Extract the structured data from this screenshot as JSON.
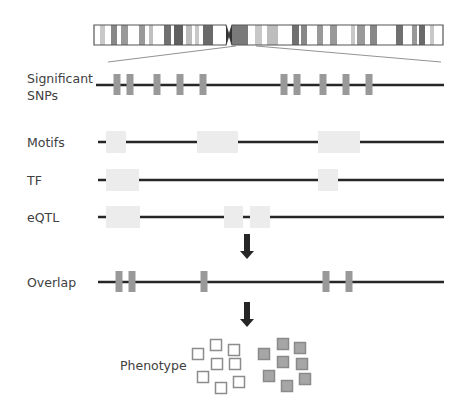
{
  "labels": {
    "significant_snps_line1": "Significant",
    "significant_snps_line2": "SNPs",
    "motifs": "Motifs",
    "tf": "TF",
    "eqtl": "eQTL",
    "overlap": "Overlap",
    "phenotype": "Phenotype"
  },
  "colors": {
    "track_line": "#262626",
    "snp_marker": "#999999",
    "region_box": "#ececec",
    "chromosome_outline": "#555555",
    "open_square": "#8c8c8c",
    "filled_square": "#a6a6a6",
    "arrow": "#262626"
  },
  "chromosome": {
    "x": 94,
    "y": 25,
    "width": 349,
    "height": 20,
    "centromere_x": 229,
    "bands": [
      {
        "x": 100,
        "w": 5,
        "c": "#c8c8c8"
      },
      {
        "x": 111,
        "w": 6,
        "c": "#888888"
      },
      {
        "x": 121,
        "w": 7,
        "c": "#999999"
      },
      {
        "x": 139,
        "w": 6,
        "c": "#999999"
      },
      {
        "x": 149,
        "w": 4,
        "c": "#c0c0c0"
      },
      {
        "x": 164,
        "w": 7,
        "c": "#707070"
      },
      {
        "x": 174,
        "w": 9,
        "c": "#606060"
      },
      {
        "x": 186,
        "w": 6,
        "c": "#bdbdbd"
      },
      {
        "x": 195,
        "w": 4,
        "c": "#c8c8c8"
      },
      {
        "x": 203,
        "w": 10,
        "c": "#6a6a6a"
      },
      {
        "x": 232,
        "w": 16,
        "c": "#7a7a7a"
      },
      {
        "x": 255,
        "w": 7,
        "c": "#c8c8c8"
      },
      {
        "x": 267,
        "w": 11,
        "c": "#bdbdbd"
      },
      {
        "x": 292,
        "w": 7,
        "c": "#707070"
      },
      {
        "x": 301,
        "w": 6,
        "c": "#888888"
      },
      {
        "x": 317,
        "w": 6,
        "c": "#999999"
      },
      {
        "x": 330,
        "w": 7,
        "c": "#999999"
      },
      {
        "x": 351,
        "w": 4,
        "c": "#c8c8c8"
      },
      {
        "x": 357,
        "w": 8,
        "c": "#999999"
      },
      {
        "x": 370,
        "w": 7,
        "c": "#888888"
      },
      {
        "x": 396,
        "w": 7,
        "c": "#707070"
      },
      {
        "x": 412,
        "w": 5,
        "c": "#999999"
      },
      {
        "x": 419,
        "w": 6,
        "c": "#6a6a6a"
      },
      {
        "x": 430,
        "w": 4,
        "c": "#c8c8c8"
      }
    ]
  },
  "zoom_lines": [
    {
      "x1": 236,
      "y1": 46,
      "x2": 108,
      "y2": 62
    },
    {
      "x1": 256,
      "y1": 46,
      "x2": 441,
      "y2": 62
    }
  ],
  "tracks": {
    "snps": {
      "y": 85,
      "x_start": 96,
      "x_end": 444,
      "markers": [
        117,
        130,
        157,
        180,
        203,
        284,
        297,
        323,
        346,
        369
      ]
    },
    "motifs": {
      "y": 142,
      "x_start": 98,
      "x_end": 444,
      "boxes": [
        [
          106,
          126
        ],
        [
          197,
          238
        ],
        [
          318,
          360
        ]
      ]
    },
    "tf": {
      "y": 180,
      "x_start": 98,
      "x_end": 444,
      "boxes": [
        [
          106,
          139
        ],
        [
          318,
          338
        ]
      ]
    },
    "eqtl": {
      "y": 217,
      "x_start": 98,
      "x_end": 444,
      "boxes": [
        [
          106,
          140
        ],
        [
          224,
          243
        ],
        [
          250,
          270
        ]
      ]
    },
    "overlap": {
      "y": 282,
      "x_start": 98,
      "x_end": 444,
      "markers": [
        119,
        132,
        204,
        326,
        349
      ]
    }
  },
  "arrows": [
    {
      "x": 247,
      "y1": 234,
      "y2": 259
    },
    {
      "x": 247,
      "y1": 302,
      "y2": 327
    }
  ],
  "phenotype_groups": {
    "open": [
      [
        198,
        354
      ],
      [
        216,
        345
      ],
      [
        234,
        350
      ],
      [
        217,
        364
      ],
      [
        235,
        364
      ],
      [
        203,
        377
      ],
      [
        221,
        388
      ],
      [
        239,
        382
      ]
    ],
    "filled": [
      [
        264,
        354
      ],
      [
        283,
        344
      ],
      [
        300,
        348
      ],
      [
        283,
        362
      ],
      [
        302,
        364
      ],
      [
        269,
        376
      ],
      [
        287,
        386
      ],
      [
        305,
        379
      ]
    ]
  }
}
